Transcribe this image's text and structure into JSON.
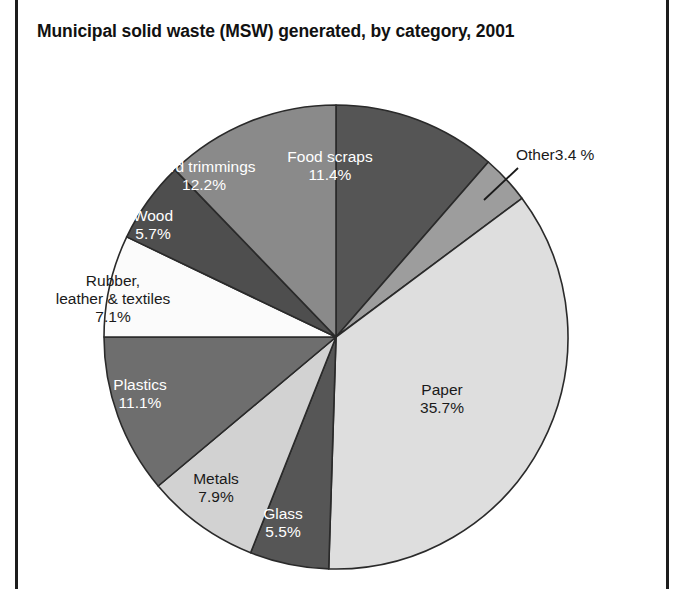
{
  "figure": {
    "title": "Municipal solid waste (MSW) generated, by category, 2001"
  },
  "chart_data": {
    "type": "pie",
    "title": "Municipal solid waste (MSW) generated, by category, 2001",
    "xlabel": "",
    "ylabel": "",
    "units": "percent",
    "start_angle_deg": 0,
    "direction": "clockwise",
    "legend": "none (slices labeled directly)",
    "grid": false,
    "categories": [
      "Food scraps",
      "Other",
      "Paper",
      "Glass",
      "Metals",
      "Plastics",
      "Rubber, leather & textiles",
      "Wood",
      "Yard trimmings"
    ],
    "values": [
      11.4,
      3.4,
      35.7,
      5.5,
      7.9,
      11.1,
      7.1,
      5.7,
      12.2
    ],
    "slices": [
      {
        "id": "food-scraps",
        "name": "Food scraps",
        "value": 11.4,
        "label_name": "Food scraps",
        "label_pct": "11.4%",
        "fill": "#555555",
        "text_color": "#ffffff",
        "label_style": "inside-light",
        "label_left": 330,
        "label_top": 148
      },
      {
        "id": "other",
        "name": "Other",
        "value": 3.4,
        "label_name": "Other",
        "label_pct": "3.4 %",
        "fill": "#9d9d9d",
        "text_color": "#1a1a1a",
        "label_style": "callout",
        "label_left": 516,
        "label_top": 146
      },
      {
        "id": "paper",
        "name": "Paper",
        "value": 35.7,
        "label_name": "Paper",
        "label_pct": "35.7%",
        "fill": "#dedede",
        "text_color": "#1a1a1a",
        "label_style": "inside-dark",
        "label_left": 442,
        "label_top": 381
      },
      {
        "id": "glass",
        "name": "Glass",
        "value": 5.5,
        "label_name": "Glass",
        "label_pct": "5.5%",
        "fill": "#565656",
        "text_color": "#ffffff",
        "label_style": "inside-light",
        "label_left": 283,
        "label_top": 505
      },
      {
        "id": "metals",
        "name": "Metals",
        "value": 7.9,
        "label_name": "Metals",
        "label_pct": "7.9%",
        "fill": "#d2d2d2",
        "text_color": "#1a1a1a",
        "label_style": "inside-dark",
        "label_left": 216,
        "label_top": 470
      },
      {
        "id": "plastics",
        "name": "Plastics",
        "value": 11.1,
        "label_name": "Plastics",
        "label_pct": "11.1%",
        "fill": "#6e6e6e",
        "text_color": "#ffffff",
        "label_style": "inside-light",
        "label_left": 140,
        "label_top": 376
      },
      {
        "id": "rubber-leather-textiles",
        "name": "Rubber, leather & textiles",
        "value": 7.1,
        "label_name": "Rubber,",
        "label_name2": "leather & textiles",
        "label_pct": "7.1%",
        "fill": "#fbfbfb",
        "text_color": "#1a1a1a",
        "label_style": "inside-dark",
        "label_left": 113,
        "label_top": 272
      },
      {
        "id": "wood",
        "name": "Wood",
        "value": 5.7,
        "label_name": "Wood",
        "label_pct": "5.7%",
        "fill": "#4e4e4e",
        "text_color": "#ffffff",
        "label_style": "inside-light",
        "label_left": 153,
        "label_top": 207
      },
      {
        "id": "yard-trimmings",
        "name": "Yard trimmings",
        "value": 12.2,
        "label_name": "Yard trimmings",
        "label_pct": "12.2%",
        "fill": "#8a8a8a",
        "text_color": "#ffffff",
        "label_style": "inside-light",
        "label_left": 204,
        "label_top": 158
      }
    ],
    "geometry": {
      "center_x": 336,
      "center_y": 337,
      "radius": 232,
      "stroke": "#2a2a2a",
      "stroke_width": 1.6
    },
    "callout": {
      "from_x": 484,
      "from_y": 200,
      "to_x": 518,
      "to_y": 168,
      "stroke": "#1a1a1a"
    }
  }
}
